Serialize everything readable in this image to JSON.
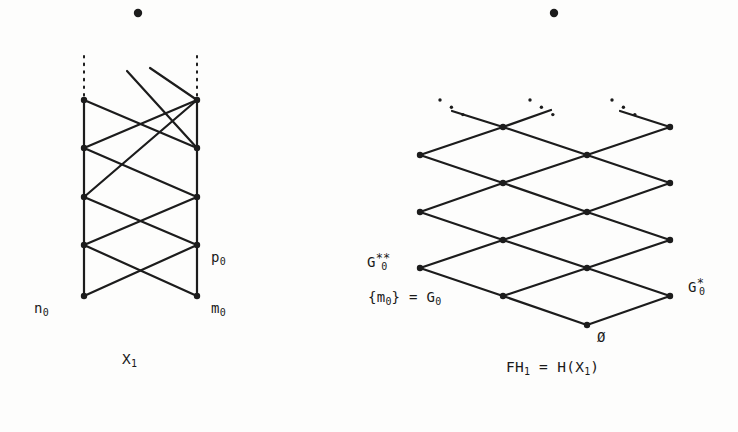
{
  "figure": {
    "ink_color": "#1c1c1c",
    "background_color": "#fdfdfc",
    "node_radius": 3.2,
    "stroke_width": 2.2
  },
  "left_diagram": {
    "name": "X1 ladder lattice",
    "caption": {
      "text": "X",
      "sub": "1",
      "x": 122,
      "y": 358
    },
    "floating_dot": {
      "cx": 138,
      "cy": 13,
      "r": 4.2
    },
    "columns": {
      "left_x": 84,
      "right_x": 197
    },
    "node_rows_y": [
      100,
      148,
      197,
      245,
      296
    ],
    "nodes": [
      {
        "id": "L0",
        "x": 84,
        "y": 100
      },
      {
        "id": "L1",
        "x": 84,
        "y": 148
      },
      {
        "id": "L2",
        "x": 84,
        "y": 197
      },
      {
        "id": "L3",
        "x": 84,
        "y": 245
      },
      {
        "id": "L4",
        "x": 84,
        "y": 296
      },
      {
        "id": "R0",
        "x": 197,
        "y": 100
      },
      {
        "id": "R1",
        "x": 197,
        "y": 148
      },
      {
        "id": "R2",
        "x": 197,
        "y": 197
      },
      {
        "id": "R3",
        "x": 197,
        "y": 245
      },
      {
        "id": "R4",
        "x": 197,
        "y": 296
      }
    ],
    "vertical_edges": [
      {
        "x1": 84,
        "y1": 100,
        "x2": 84,
        "y2": 296
      },
      {
        "x1": 197,
        "y1": 100,
        "x2": 197,
        "y2": 296
      }
    ],
    "dotted_stems": [
      {
        "x": 84,
        "y1": 56,
        "y2": 98
      },
      {
        "x": 197,
        "y1": 56,
        "y2": 98
      }
    ],
    "diagonal_edges": [
      {
        "x1": 84,
        "y1": 100,
        "x2": 197,
        "y2": 148
      },
      {
        "x1": 84,
        "y1": 148,
        "x2": 197,
        "y2": 197
      },
      {
        "x1": 84,
        "y1": 197,
        "x2": 197,
        "y2": 245
      },
      {
        "x1": 84,
        "y1": 245,
        "x2": 197,
        "y2": 296
      },
      {
        "x1": 84,
        "y1": 148,
        "x2": 197,
        "y2": 100
      },
      {
        "x1": 84,
        "y1": 245,
        "x2": 197,
        "y2": 197
      },
      {
        "x1": 84,
        "y1": 296,
        "x2": 197,
        "y2": 245
      },
      {
        "x1": 84,
        "y1": 197,
        "x2": 197,
        "y2": 100
      },
      {
        "x1": 150,
        "y1": 68,
        "x2": 197,
        "y2": 100
      },
      {
        "x1": 127,
        "y1": 71,
        "x2": 197,
        "y2": 148
      }
    ],
    "labels": [
      {
        "id": "n0",
        "text": "n",
        "sub": "0",
        "x": 34,
        "y": 308
      },
      {
        "id": "m0",
        "text": "m",
        "sub": "0",
        "x": 211,
        "y": 308
      },
      {
        "id": "p0",
        "text": "p",
        "sub": "0",
        "x": 211,
        "y": 257
      }
    ]
  },
  "right_diagram": {
    "name": "FH1 diamond lattice",
    "caption": {
      "text_before": "FH",
      "sub_before": "1",
      "equals": " = ",
      "text_after": "H(X",
      "sub_after": "1",
      "text_close": ")",
      "x": 506,
      "y": 366
    },
    "floating_dot": {
      "cx": 554,
      "cy": 13,
      "r": 4.2
    },
    "nodes": [
      {
        "id": "A",
        "x": 420,
        "y": 155
      },
      {
        "id": "B",
        "x": 420,
        "y": 212
      },
      {
        "id": "C",
        "x": 420,
        "y": 268
      },
      {
        "id": "D",
        "x": 503,
        "y": 127
      },
      {
        "id": "E",
        "x": 503,
        "y": 183
      },
      {
        "id": "F",
        "x": 503,
        "y": 240
      },
      {
        "id": "G",
        "x": 503,
        "y": 296
      },
      {
        "id": "H",
        "x": 587,
        "y": 155
      },
      {
        "id": "I",
        "x": 587,
        "y": 212
      },
      {
        "id": "J",
        "x": 587,
        "y": 268
      },
      {
        "id": "K",
        "x": 587,
        "y": 325
      },
      {
        "id": "L",
        "x": 670,
        "y": 127
      },
      {
        "id": "M",
        "x": 670,
        "y": 183
      },
      {
        "id": "N",
        "x": 670,
        "y": 240
      },
      {
        "id": "O",
        "x": 670,
        "y": 296
      }
    ],
    "edges": [
      {
        "x1": 420,
        "y1": 155,
        "x2": 503,
        "y2": 127
      },
      {
        "x1": 420,
        "y1": 155,
        "x2": 503,
        "y2": 183
      },
      {
        "x1": 420,
        "y1": 212,
        "x2": 503,
        "y2": 183
      },
      {
        "x1": 420,
        "y1": 212,
        "x2": 503,
        "y2": 240
      },
      {
        "x1": 420,
        "y1": 268,
        "x2": 503,
        "y2": 240
      },
      {
        "x1": 420,
        "y1": 268,
        "x2": 503,
        "y2": 296
      },
      {
        "x1": 503,
        "y1": 127,
        "x2": 587,
        "y2": 155
      },
      {
        "x1": 503,
        "y1": 183,
        "x2": 587,
        "y2": 155
      },
      {
        "x1": 503,
        "y1": 183,
        "x2": 587,
        "y2": 212
      },
      {
        "x1": 503,
        "y1": 240,
        "x2": 587,
        "y2": 212
      },
      {
        "x1": 503,
        "y1": 240,
        "x2": 587,
        "y2": 268
      },
      {
        "x1": 503,
        "y1": 296,
        "x2": 587,
        "y2": 268
      },
      {
        "x1": 503,
        "y1": 296,
        "x2": 587,
        "y2": 325
      },
      {
        "x1": 587,
        "y1": 155,
        "x2": 670,
        "y2": 127
      },
      {
        "x1": 587,
        "y1": 155,
        "x2": 670,
        "y2": 183
      },
      {
        "x1": 587,
        "y1": 212,
        "x2": 670,
        "y2": 183
      },
      {
        "x1": 587,
        "y1": 212,
        "x2": 670,
        "y2": 240
      },
      {
        "x1": 587,
        "y1": 268,
        "x2": 670,
        "y2": 240
      },
      {
        "x1": 587,
        "y1": 268,
        "x2": 670,
        "y2": 296
      },
      {
        "x1": 587,
        "y1": 325,
        "x2": 670,
        "y2": 296
      },
      {
        "x1": 452,
        "y1": 111,
        "x2": 503,
        "y2": 127
      },
      {
        "x1": 503,
        "y1": 127,
        "x2": 551,
        "y2": 110
      },
      {
        "x1": 620,
        "y1": 111,
        "x2": 670,
        "y2": 127
      }
    ],
    "dot_clusters": [
      {
        "cx": 440,
        "cy": 100,
        "angle": -18,
        "count": 3
      },
      {
        "cx": 530,
        "cy": 100,
        "angle": -18,
        "count": 3
      },
      {
        "cx": 612,
        "cy": 100,
        "angle": -18,
        "count": 3
      }
    ],
    "labels": [
      {
        "id": "G0-double-star",
        "text": "G",
        "sub": "0",
        "sup": "**",
        "x": 367,
        "y": 258
      },
      {
        "id": "m0-eq-G0",
        "text": "{m",
        "sub": "0",
        "text2": "} = G",
        "sub2": "0",
        "x": 368,
        "y": 296
      },
      {
        "id": "empty-set",
        "text": "Ø",
        "x": 597,
        "y": 336
      },
      {
        "id": "G0-star",
        "text": "G",
        "sub": "0",
        "sup": "*",
        "x": 688,
        "y": 283
      }
    ]
  }
}
